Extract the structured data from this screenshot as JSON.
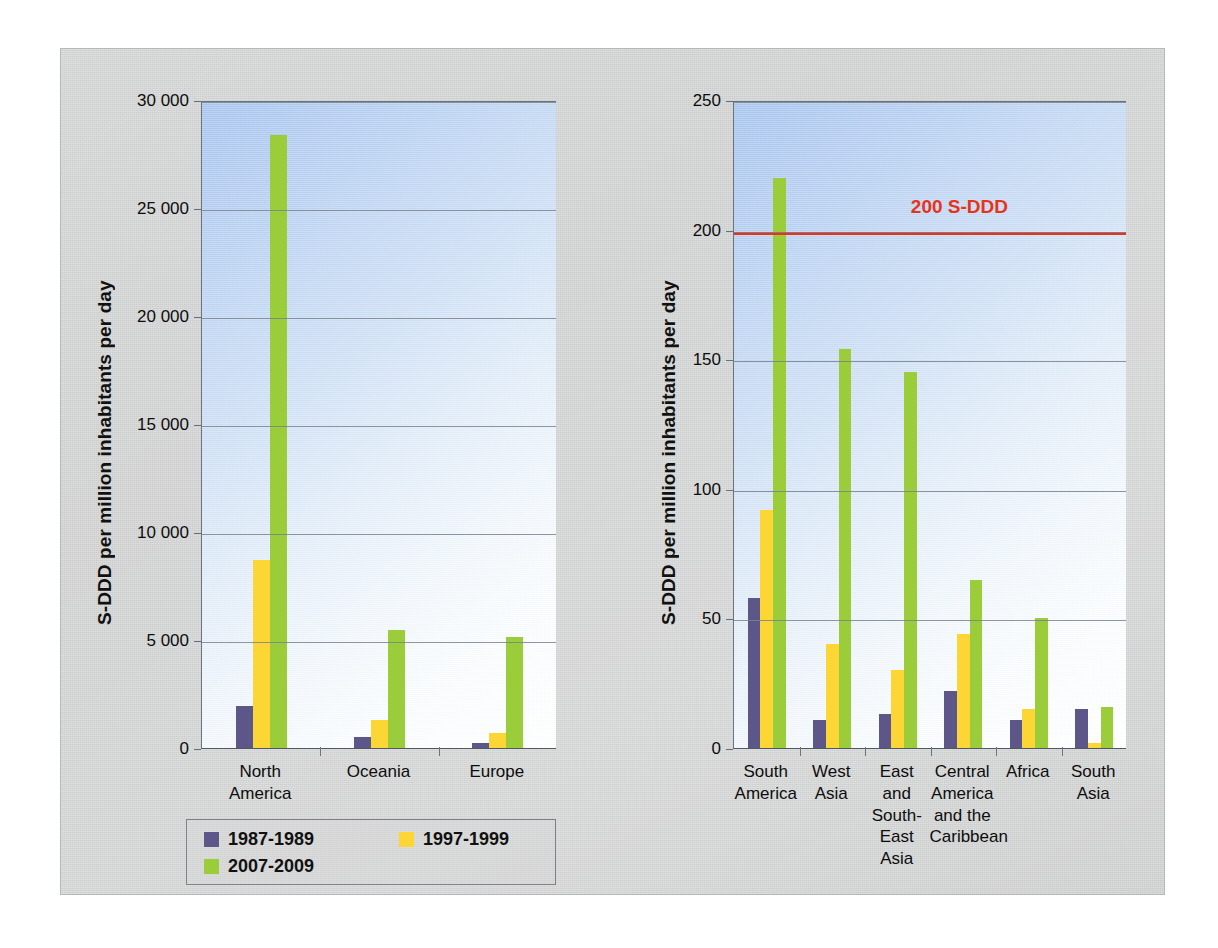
{
  "figure": {
    "background_color": "#d2d3d3",
    "series_colors": {
      "1987-1989": "#5c5689",
      "1997-1999": "#fcd634",
      "2007-2009": "#9bcd3b"
    },
    "threshold_color": "#e8331a"
  },
  "legend": {
    "entries": [
      {
        "label": "1987-1989",
        "color": "#5c5689"
      },
      {
        "label": "1997-1999",
        "color": "#fcd634"
      },
      {
        "label": "2007-2009",
        "color": "#9bcd3b"
      }
    ]
  },
  "chart_data": [
    {
      "id": "left",
      "type": "bar",
      "title": "",
      "xlabel": "",
      "ylabel": "S-DDD per million inhabitants per day",
      "ylim": [
        0,
        30000
      ],
      "yticks": [
        0,
        5000,
        10000,
        15000,
        20000,
        25000,
        30000
      ],
      "ytick_labels": [
        "0",
        "5 000",
        "10 000",
        "15 000",
        "20 000",
        "25 000",
        "30 000"
      ],
      "grid": true,
      "legend_position": "below-left",
      "categories": [
        "North\nAmerica",
        "Oceania",
        "Europe"
      ],
      "series": [
        {
          "name": "1987-1989",
          "color": "#5c5689",
          "values": [
            1950,
            500,
            230
          ]
        },
        {
          "name": "1997-1999",
          "color": "#fcd634",
          "values": [
            8700,
            1300,
            700
          ]
        },
        {
          "name": "2007-2009",
          "color": "#9bcd3b",
          "values": [
            28400,
            5450,
            5150
          ]
        }
      ]
    },
    {
      "id": "right",
      "type": "bar",
      "title": "",
      "xlabel": "",
      "ylabel": "S-DDD per million inhabitants per day",
      "ylim": [
        0,
        250
      ],
      "yticks": [
        0,
        50,
        100,
        150,
        200,
        250
      ],
      "ytick_labels": [
        "0",
        "50",
        "100",
        "150",
        "200",
        "250"
      ],
      "grid": true,
      "legend_position": "shared",
      "categories": [
        "South\nAmerica",
        "West\nAsia",
        "East and\nSouth-\nEast\nAsia",
        "Central\nAmerica\nand the\nCaribbean",
        "Africa",
        "South\nAsia"
      ],
      "series": [
        {
          "name": "1987-1989",
          "color": "#5c5689",
          "values": [
            58,
            11,
            13,
            22,
            11,
            15
          ]
        },
        {
          "name": "1997-1999",
          "color": "#fcd634",
          "values": [
            92,
            40,
            30,
            44,
            15,
            2
          ]
        },
        {
          "name": "2007-2009",
          "color": "#9bcd3b",
          "values": [
            220,
            154,
            145,
            65,
            50,
            16
          ]
        }
      ],
      "annotations": [
        {
          "type": "hline",
          "value": 200,
          "label": "200 S-DDD",
          "color": "#e8331a"
        }
      ]
    }
  ]
}
